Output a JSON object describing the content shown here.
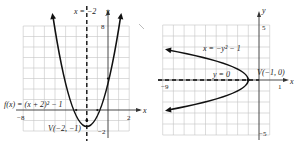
{
  "left_graph": {
    "function_label": "f(x) = (x + 2)² − 1",
    "axis_of_symmetry_label": "x = −2",
    "vertex_label": "V(−2, −1)",
    "x_axis_label": "x",
    "y_axis_label": "y",
    "ticks": {
      "x_min": "−8",
      "x_max": "2",
      "y_max": "8",
      "y_min": "−2"
    },
    "x_range": [
      -8,
      2
    ],
    "y_range": [
      -2,
      8
    ]
  },
  "right_graph": {
    "function_label": "x = −y² − 1",
    "axis_of_symmetry_label": "y = 0",
    "vertex_label": "V(−1, 0)",
    "x_axis_label": "x",
    "y_axis_label": "y",
    "ticks": {
      "x_min": "−9",
      "x_max": "1",
      "y_max": "5",
      "y_min": "−5"
    },
    "x_range": [
      -9,
      1
    ],
    "y_range": [
      -5,
      5
    ]
  },
  "colors": {
    "curve": "#111111",
    "grid": "#bdbdbd",
    "axis": "#333333"
  }
}
